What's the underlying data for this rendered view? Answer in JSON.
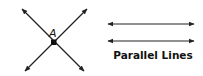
{
  "diagram": {
    "intersecting_lines": {
      "point_label": "A",
      "color": "#222222",
      "line1": {
        "x1": 22,
        "y1": 9,
        "x2": 84,
        "y2": 71
      },
      "line2": {
        "x1": 87,
        "y1": 9,
        "x2": 25,
        "y2": 71
      },
      "intersection": {
        "x": 54,
        "y": 42
      }
    },
    "parallel_lines": {
      "caption": "Parallel Lines",
      "color": "#222222",
      "lines": [
        {
          "x1": 108,
          "x2": 194,
          "y": 24
        },
        {
          "x1": 108,
          "x2": 194,
          "y": 41
        }
      ]
    }
  }
}
